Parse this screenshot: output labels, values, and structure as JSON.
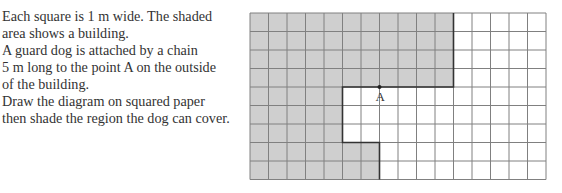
{
  "question": {
    "lines": [
      "Each square is 1 m wide. The shaded",
      "area shows a building.",
      "A guard dog is attached by a chain",
      "5 m long to the point A on the outside",
      "of the building.",
      "Draw the diagram on squared paper",
      "then shade the region the dog can cover."
    ]
  },
  "diagram": {
    "columns": 16,
    "rows": 9,
    "cell_size_px": 18.5,
    "cell_size_m": 1,
    "shaded_color": "#cfcfcf",
    "grid_line_color": "#808080",
    "outline_color": "#333333",
    "building_shaded_cells_by_row": [
      [
        0,
        10
      ],
      [
        0,
        10
      ],
      [
        0,
        10
      ],
      [
        0,
        10
      ],
      [
        0,
        4
      ],
      [
        0,
        4
      ],
      [
        0,
        4
      ],
      [
        0,
        6
      ],
      [
        0,
        6
      ]
    ],
    "point": {
      "label": "A",
      "col": 7,
      "row": 4
    },
    "chain_length_m": 5
  }
}
